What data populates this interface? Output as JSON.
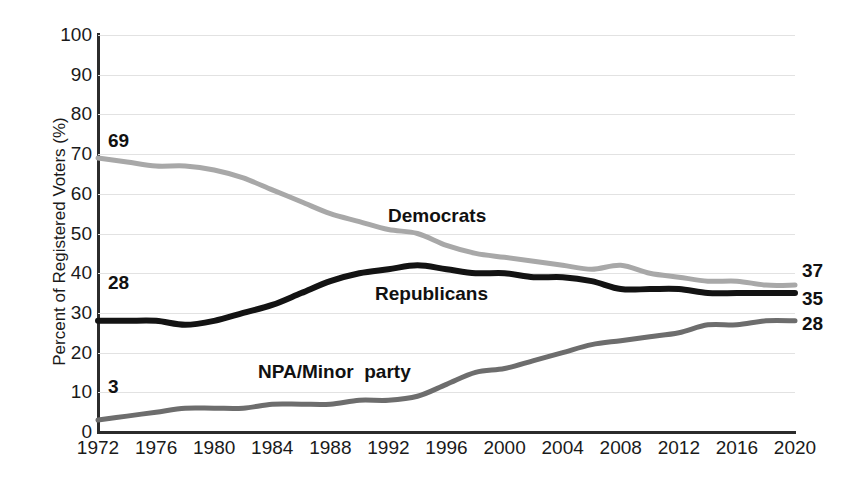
{
  "chart_data": {
    "type": "line",
    "title": "",
    "xlabel": "",
    "ylabel": "Percent of Registered Voters (%)",
    "ylim": [
      0,
      100
    ],
    "xlim": [
      1972,
      2020
    ],
    "grid": true,
    "legend_position": "inline-annotations",
    "y_ticks": [
      100,
      90,
      80,
      70,
      60,
      50,
      40,
      30,
      20,
      10,
      0
    ],
    "x_ticks": [
      1972,
      1976,
      1980,
      1984,
      1988,
      1992,
      1996,
      2000,
      2004,
      2008,
      2012,
      2016,
      2020
    ],
    "x": [
      1972,
      1974,
      1976,
      1978,
      1980,
      1982,
      1984,
      1986,
      1988,
      1990,
      1992,
      1994,
      1996,
      1998,
      2000,
      2002,
      2004,
      2006,
      2008,
      2010,
      2012,
      2014,
      2016,
      2018,
      2020
    ],
    "series": [
      {
        "name": "Democrats",
        "color": "#a8a8a8",
        "start_label": "69",
        "end_label": "37",
        "values": [
          69,
          68,
          67,
          67,
          66,
          64,
          61,
          58,
          55,
          53,
          51,
          50,
          47,
          45,
          44,
          43,
          42,
          41,
          42,
          40,
          39,
          38,
          38,
          37,
          37
        ]
      },
      {
        "name": "Republicans",
        "color": "#131313",
        "start_label": "28",
        "end_label": "35",
        "values": [
          28,
          28,
          28,
          27,
          28,
          30,
          32,
          35,
          38,
          40,
          41,
          42,
          41,
          40,
          40,
          39,
          39,
          38,
          36,
          36,
          36,
          35,
          35,
          35,
          35
        ]
      },
      {
        "name": "NPA/Minor  party",
        "color": "#6d6d6d",
        "start_label": "3",
        "end_label": "28",
        "values": [
          3,
          4,
          5,
          6,
          6,
          6,
          7,
          7,
          7,
          8,
          8,
          9,
          12,
          15,
          16,
          18,
          20,
          22,
          23,
          24,
          25,
          27,
          27,
          28,
          28
        ]
      }
    ],
    "annotations": [
      {
        "text": "Democrats",
        "x_px": 388,
        "y_px": 205
      },
      {
        "text": "Republicans",
        "x_px": 375,
        "y_px": 283
      },
      {
        "text": "NPA/Minor  party",
        "x_px": 258,
        "y_px": 361
      }
    ],
    "left_callouts": [
      {
        "text": "69",
        "x_px": 108,
        "y_px": 130
      },
      {
        "text": "28",
        "x_px": 108,
        "y_px": 272
      },
      {
        "text": "3",
        "x_px": 108,
        "y_px": 376
      }
    ],
    "right_callouts": [
      {
        "text": "37",
        "x_px": 802,
        "y_px": 260
      },
      {
        "text": "35",
        "x_px": 802,
        "y_px": 288
      },
      {
        "text": "28",
        "x_px": 802,
        "y_px": 313
      }
    ]
  }
}
